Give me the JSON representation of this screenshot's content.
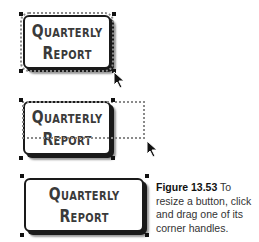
{
  "figures": [
    {
      "state": "selected",
      "label_line1": "Quarterly",
      "label_line2": "Report"
    },
    {
      "state": "resizing",
      "label_line1": "Quarterly",
      "label_line2": "Report"
    },
    {
      "state": "resized",
      "label_line1": "Quarterly",
      "label_line2": "Report"
    }
  ],
  "caption": {
    "figure_number": "Figure 13.53",
    "text": " To resize a button, click and drag one of its corner handles."
  },
  "icons": {
    "cursor": "arrow-pointer-icon",
    "handle": "resize-handle-icon"
  }
}
